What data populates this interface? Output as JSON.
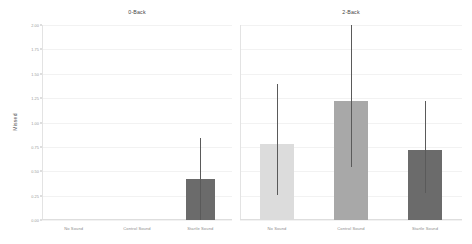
{
  "chart_data": {
    "type": "bar",
    "title": "",
    "xlabel": "",
    "ylabel": "Missed",
    "ylim": [
      0.0,
      2.0
    ],
    "grid": true,
    "legend_position": "none",
    "facet_titles": [
      "0-Back",
      "2-Back"
    ],
    "categories": [
      "No Sound",
      "Control Sound",
      "Startle Sound"
    ],
    "y_ticks": [
      {
        "value": 0.0,
        "label": "0.00"
      },
      {
        "value": 0.25,
        "label": "0.25"
      },
      {
        "value": 0.5,
        "label": "0.50"
      },
      {
        "value": 0.75,
        "label": "0.75"
      },
      {
        "value": 1.0,
        "label": "1.00"
      },
      {
        "value": 1.25,
        "label": "1.25"
      },
      {
        "value": 1.5,
        "label": "1.50"
      },
      {
        "value": 1.75,
        "label": "1.75"
      },
      {
        "value": 2.0,
        "label": "2.00"
      }
    ],
    "panels": [
      {
        "facet": "0-Back",
        "bars": [
          {
            "category": "No Sound",
            "value": 0.0,
            "err_low": 0.0,
            "err_high": 0.0,
            "color": "#dcdcdc"
          },
          {
            "category": "Control Sound",
            "value": 0.0,
            "err_low": 0.0,
            "err_high": 0.0,
            "color": "#a8a8a8"
          },
          {
            "category": "Startle Sound",
            "value": 0.42,
            "err_low": 0.0,
            "err_high": 0.84,
            "color": "#6b6b6b"
          }
        ]
      },
      {
        "facet": "2-Back",
        "bars": [
          {
            "category": "No Sound",
            "value": 0.78,
            "err_low": 0.26,
            "err_high": 1.39,
            "color": "#dcdcdc"
          },
          {
            "category": "Control Sound",
            "value": 1.22,
            "err_low": 0.54,
            "err_high": 2.0,
            "color": "#a8a8a8"
          },
          {
            "category": "Startle Sound",
            "value": 0.72,
            "err_low": 0.28,
            "err_high": 1.22,
            "color": "#6b6b6b"
          }
        ]
      }
    ],
    "colors": {
      "bar_no_sound": "#dcdcdc",
      "bar_control_sound": "#a8a8a8",
      "bar_startle_sound": "#6b6b6b",
      "errorbar": "#5a5a5a",
      "gridline": "#f2f2f2",
      "axis_text": "#9a9a9a",
      "title_text": "#3f3f3f",
      "background": "#ffffff"
    }
  }
}
